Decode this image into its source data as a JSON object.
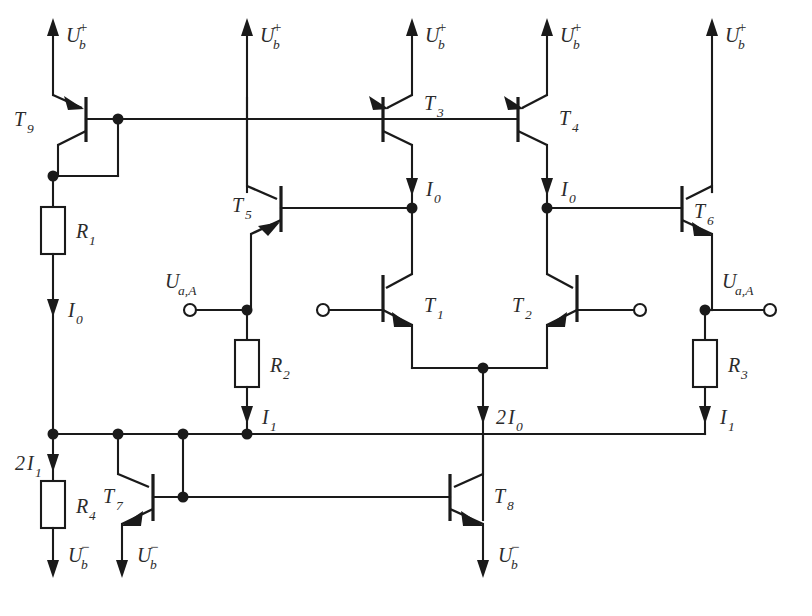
{
  "diagram": {
    "type": "transistor-level operational amplifier schematic",
    "line_color": "#1a1a1a",
    "background_color": "#ffffff",
    "text_color": "#2b2b2b"
  },
  "supply_rails": {
    "positive_symbol": "U",
    "positive_sub": "b",
    "positive_sup": "+",
    "negative_symbol": "U",
    "negative_sub": "b",
    "negative_sup": "−",
    "positive_count": 5,
    "negative_count": 3
  },
  "transistors": [
    {
      "id": "T9",
      "label": "T",
      "sub": "9",
      "kind": "pnp",
      "x": 53,
      "y": 119
    },
    {
      "id": "T5",
      "label": "T",
      "sub": "5",
      "kind": "pnp",
      "x": 247,
      "y": 208
    },
    {
      "id": "T3",
      "label": "T",
      "sub": "3",
      "kind": "pnp",
      "x": 383,
      "y": 119
    },
    {
      "id": "T4",
      "label": "T",
      "sub": "4",
      "kind": "pnp",
      "x": 518,
      "y": 119
    },
    {
      "id": "T6",
      "label": "T",
      "sub": "6",
      "kind": "npn",
      "x": 682,
      "y": 208
    },
    {
      "id": "T1",
      "label": "T",
      "sub": "1",
      "kind": "npn",
      "x": 383,
      "y": 310
    },
    {
      "id": "T2",
      "label": "T",
      "sub": "2",
      "kind": "npn",
      "x": 547,
      "y": 310
    },
    {
      "id": "T7",
      "label": "T",
      "sub": "7",
      "kind": "npn",
      "x": 153,
      "y": 497
    },
    {
      "id": "T8",
      "label": "T",
      "sub": "8",
      "kind": "npn",
      "x": 450,
      "y": 497
    }
  ],
  "resistors": [
    {
      "id": "R1",
      "label": "R",
      "sub": "1",
      "x": 53,
      "y": 230
    },
    {
      "id": "R2",
      "label": "R",
      "sub": "2",
      "x": 247,
      "y": 362
    },
    {
      "id": "R3",
      "label": "R",
      "sub": "3",
      "x": 705,
      "y": 362
    },
    {
      "id": "R4",
      "label": "R",
      "sub": "4",
      "x": 53,
      "y": 504
    }
  ],
  "currents": [
    {
      "id": "I0-left",
      "label": "I",
      "sub": "0",
      "prefix": "",
      "x": 53,
      "y": 307
    },
    {
      "id": "I0-T3",
      "label": "I",
      "sub": "0",
      "prefix": "",
      "x": 412,
      "y": 186
    },
    {
      "id": "I0-T4",
      "label": "I",
      "sub": "0",
      "prefix": "",
      "x": 547,
      "y": 186
    },
    {
      "id": "I1-R2",
      "label": "I",
      "sub": "1",
      "prefix": "",
      "x": 247,
      "y": 414
    },
    {
      "id": "I1-R3",
      "label": "I",
      "sub": "1",
      "prefix": "",
      "x": 705,
      "y": 414
    },
    {
      "id": "2I0-pair",
      "label": "I",
      "sub": "0",
      "prefix": "2",
      "x": 483,
      "y": 414
    },
    {
      "id": "2I1-R4",
      "label": "I",
      "sub": "1",
      "prefix": "2",
      "x": 53,
      "y": 462
    }
  ],
  "terminals": [
    {
      "id": "Ua-A-left",
      "label": "U",
      "sub": "a,A",
      "x": 190,
      "y": 310,
      "has_label": true
    },
    {
      "id": "in-left",
      "label": "",
      "sub": "",
      "x": 323,
      "y": 310,
      "has_label": false
    },
    {
      "id": "in-right",
      "label": "",
      "sub": "",
      "x": 640,
      "y": 310,
      "has_label": false
    },
    {
      "id": "Ua-A-right",
      "label": "U",
      "sub": "a,A",
      "x": 770,
      "y": 310,
      "has_label": true
    }
  ],
  "nodes": [
    {
      "id": "n-t9-base",
      "x": 118,
      "y": 119
    },
    {
      "id": "n-t9-collector",
      "x": 53,
      "y": 176
    },
    {
      "id": "n-t3-collector",
      "x": 412,
      "y": 208
    },
    {
      "id": "n-t4-collector",
      "x": 547,
      "y": 208
    },
    {
      "id": "n-ua-left",
      "x": 247,
      "y": 310
    },
    {
      "id": "n-ua-right",
      "x": 705,
      "y": 310
    },
    {
      "id": "n-diffpair",
      "x": 483,
      "y": 368
    },
    {
      "id": "n-rail-1",
      "x": 53,
      "y": 434
    },
    {
      "id": "n-rail-2",
      "x": 118,
      "y": 434
    },
    {
      "id": "n-rail-3",
      "x": 183,
      "y": 434
    },
    {
      "id": "n-rail-4",
      "x": 247,
      "y": 434
    },
    {
      "id": "n-t7-base",
      "x": 183,
      "y": 497
    }
  ],
  "labels_text": {
    "ua_a": "U",
    "ua_a_sub": "a,A",
    "current_i": "I",
    "two": "2"
  }
}
